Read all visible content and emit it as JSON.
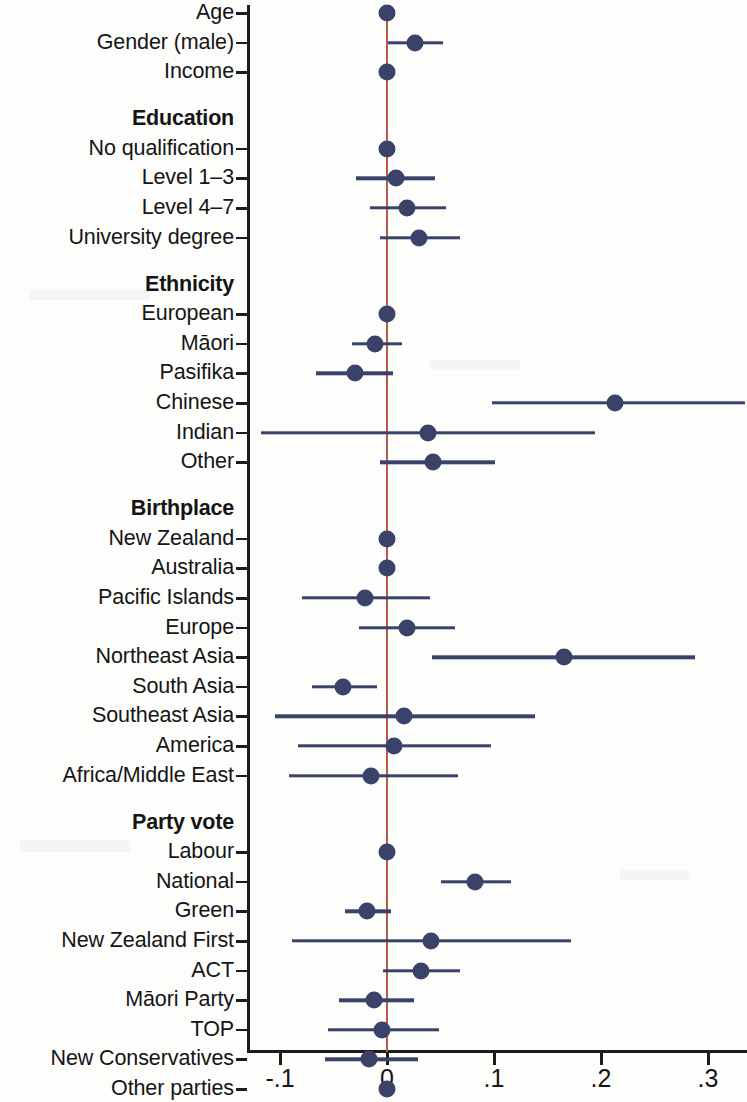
{
  "chart_data": {
    "type": "scatter",
    "title": "",
    "subtitle": "",
    "xlabel": "",
    "ylabel": "",
    "xlim": [
      -0.135,
      0.337
    ],
    "grid": false,
    "legend": null,
    "reference_line": {
      "value": 0,
      "color": "#b85a48"
    },
    "marker_color": "#3b4269",
    "xticks": [
      -0.1,
      0,
      0.1,
      0.2,
      0.3
    ],
    "xticklabels": [
      "-.1",
      "0",
      ".1",
      ".2",
      ".3"
    ],
    "groups": [
      {
        "header": "",
        "rows": [
          {
            "label": "Age",
            "estimate": 0.0,
            "ci_low": 0.0,
            "ci_high": 0.0
          },
          {
            "label": "Gender (male)",
            "estimate": 0.026,
            "ci_low": 0.001,
            "ci_high": 0.052
          },
          {
            "label": "Income",
            "estimate": 0.0,
            "ci_low": 0.0,
            "ci_high": 0.0
          }
        ]
      },
      {
        "header": "Education",
        "rows": [
          {
            "label": "No qualification",
            "estimate": 0.0,
            "ci_low": 0.0,
            "ci_high": 0.0
          },
          {
            "label": "Level 1–3",
            "estimate": 0.008,
            "ci_low": -0.029,
            "ci_high": 0.045
          },
          {
            "label": "Level 4–7",
            "estimate": 0.019,
            "ci_low": -0.016,
            "ci_high": 0.055
          },
          {
            "label": "University degree",
            "estimate": 0.03,
            "ci_low": -0.007,
            "ci_high": 0.068
          }
        ]
      },
      {
        "header": "Ethnicity",
        "rows": [
          {
            "label": "European",
            "estimate": 0.0,
            "ci_low": 0.0,
            "ci_high": 0.0
          },
          {
            "label": "Māori",
            "estimate": -0.011,
            "ci_low": -0.033,
            "ci_high": 0.014
          },
          {
            "label": "Pasifika",
            "estimate": -0.03,
            "ci_low": -0.066,
            "ci_high": 0.006
          },
          {
            "label": "Chinese",
            "estimate": 0.213,
            "ci_low": 0.098,
            "ci_high": 0.335
          },
          {
            "label": "Indian",
            "estimate": 0.038,
            "ci_low": -0.118,
            "ci_high": 0.194
          },
          {
            "label": "Other",
            "estimate": 0.043,
            "ci_low": -0.007,
            "ci_high": 0.101
          }
        ]
      },
      {
        "header": "Birthplace",
        "rows": [
          {
            "label": "New Zealand",
            "estimate": 0.0,
            "ci_low": 0.0,
            "ci_high": 0.0
          },
          {
            "label": "Australia",
            "estimate": 0.0,
            "ci_low": -0.003,
            "ci_high": 0.004
          },
          {
            "label": "Pacific Islands",
            "estimate": -0.021,
            "ci_low": -0.079,
            "ci_high": 0.04
          },
          {
            "label": "Europe",
            "estimate": 0.019,
            "ci_low": -0.026,
            "ci_high": 0.064
          },
          {
            "label": "Northeast Asia",
            "estimate": 0.165,
            "ci_low": 0.042,
            "ci_high": 0.288
          },
          {
            "label": "South Asia",
            "estimate": -0.041,
            "ci_low": -0.07,
            "ci_high": -0.009
          },
          {
            "label": "Southeast Asia",
            "estimate": 0.016,
            "ci_low": -0.105,
            "ci_high": 0.138
          },
          {
            "label": "America",
            "estimate": 0.007,
            "ci_low": -0.083,
            "ci_high": 0.097
          },
          {
            "label": "Africa/Middle East",
            "estimate": -0.015,
            "ci_low": -0.092,
            "ci_high": 0.066
          }
        ]
      },
      {
        "header": "Party vote",
        "rows": [
          {
            "label": "Labour",
            "estimate": 0.0,
            "ci_low": 0.0,
            "ci_high": 0.0
          },
          {
            "label": "National",
            "estimate": 0.082,
            "ci_low": 0.05,
            "ci_high": 0.116
          },
          {
            "label": "Green",
            "estimate": -0.019,
            "ci_low": -0.039,
            "ci_high": 0.004
          },
          {
            "label": "New Zealand First",
            "estimate": 0.041,
            "ci_low": -0.089,
            "ci_high": 0.172
          },
          {
            "label": "ACT",
            "estimate": 0.032,
            "ci_low": -0.004,
            "ci_high": 0.068
          },
          {
            "label": "Māori Party",
            "estimate": -0.012,
            "ci_low": -0.045,
            "ci_high": 0.025
          },
          {
            "label": "TOP",
            "estimate": -0.005,
            "ci_low": -0.055,
            "ci_high": 0.049
          },
          {
            "label": "New Conservatives",
            "estimate": -0.017,
            "ci_low": -0.058,
            "ci_high": 0.029
          },
          {
            "label": "Other parties",
            "estimate": 0.0,
            "ci_low": 0.0,
            "ci_high": 0.0
          },
          {
            "label": "Nonvote",
            "estimate": 0.039,
            "ci_low": -0.011,
            "ci_high": 0.09
          }
        ]
      }
    ]
  }
}
